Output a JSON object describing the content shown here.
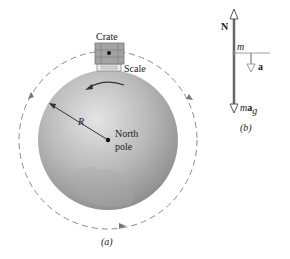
{
  "figure_a": {
    "caption": "(a)",
    "crate_label": "Crate",
    "scale_label": "Scale",
    "radius_label": "R",
    "pole_label_line1": "North",
    "pole_label_line2": "pole",
    "colors": {
      "globe_light": "#e2e2e2",
      "globe_dark": "#8f8f8f",
      "dashed_orbit": "#888888",
      "crate": "#9a9a9a",
      "scale": "#e8e8e8"
    }
  },
  "figure_b": {
    "caption": "(b)",
    "normal_force_label": "N",
    "mass_label": "m",
    "acceleration_label": "a",
    "gravity_label_m": "m",
    "gravity_label_a": "a",
    "gravity_label_sub": "g",
    "colors": {
      "force_arrow": "#666666",
      "accel_arrow": "#999999"
    }
  }
}
